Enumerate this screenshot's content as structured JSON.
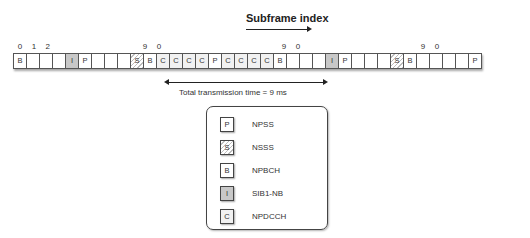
{
  "title": "Subframe index",
  "subframe_indices": [
    {
      "label": "0",
      "cell": 0
    },
    {
      "label": "1",
      "cell": 1
    },
    {
      "label": "2",
      "cell": 2
    },
    {
      "label": "9",
      "cell": 9
    },
    {
      "label": "0",
      "cell": 10
    },
    {
      "label": "9",
      "cell": 19
    },
    {
      "label": "0",
      "cell": 20
    },
    {
      "label": "9",
      "cell": 29
    },
    {
      "label": "0",
      "cell": 30
    }
  ],
  "cells": [
    "B",
    "",
    "",
    "",
    "I",
    "P",
    "",
    "",
    "",
    "S",
    "B",
    "C",
    "C",
    "C",
    "C",
    "P",
    "C",
    "C",
    "C",
    "C",
    "B",
    "",
    "",
    "",
    "I",
    "P",
    "",
    "",
    "",
    "S",
    "B",
    "",
    "",
    "",
    "",
    "P"
  ],
  "span": {
    "label": "Total transmission time = 9 ms"
  },
  "legend": [
    {
      "symbol": "P",
      "label": "NPSS"
    },
    {
      "symbol": "S",
      "label": "NSSS"
    },
    {
      "symbol": "B",
      "label": "NPBCH"
    },
    {
      "symbol": "I",
      "label": "SIB1-NB"
    },
    {
      "symbol": "C",
      "label": "NPDCCH"
    }
  ]
}
